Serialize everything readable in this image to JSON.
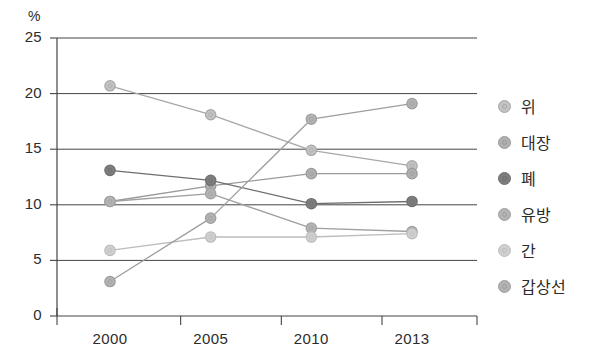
{
  "chart_data": {
    "type": "line",
    "title": "",
    "subtitle": "",
    "xlabel": "",
    "ylabel": "%",
    "unit_label": "%",
    "categories": [
      "2000",
      "2005",
      "2010",
      "2013"
    ],
    "x": [
      2000,
      2005,
      2010,
      2013
    ],
    "xtick_labels": [
      "2000",
      "2005",
      "2010",
      "2013"
    ],
    "ytick_labels": [
      "0",
      "5",
      "10",
      "15",
      "20",
      "25"
    ],
    "yticks": [
      0,
      5,
      10,
      15,
      20,
      25
    ],
    "ylim": [
      0,
      25
    ],
    "grid": "horizontal",
    "legend_position": "right",
    "markers": "circle",
    "series": [
      {
        "name": "위",
        "color": "#a8a8a8",
        "marker_fill": "#c2c2c2",
        "values": [
          20.7,
          18.1,
          14.9,
          13.5
        ]
      },
      {
        "name": "대장",
        "color": "#9a9a9a",
        "marker_fill": "#b0b0b0",
        "values": [
          10.3,
          11.7,
          12.8,
          12.8
        ]
      },
      {
        "name": "폐",
        "color": "#6e6e6e",
        "marker_fill": "#7d7d7d",
        "values": [
          13.1,
          12.2,
          10.1,
          10.3
        ]
      },
      {
        "name": "유방",
        "color": "#a0a0a0",
        "marker_fill": "#b4b4b4",
        "values": [
          10.3,
          11.0,
          7.9,
          7.6
        ]
      },
      {
        "name": "간",
        "color": "#bdbdbd",
        "marker_fill": "#cfcfcf",
        "values": [
          5.9,
          7.1,
          7.1,
          7.4
        ]
      },
      {
        "name": "갑상선",
        "color": "#9e9e9e",
        "marker_fill": "#b2b2b2",
        "values": [
          3.1,
          8.8,
          17.7,
          19.1
        ]
      }
    ]
  },
  "legend": {
    "items": [
      {
        "label": "위"
      },
      {
        "label": "대장"
      },
      {
        "label": "폐"
      },
      {
        "label": "유방"
      },
      {
        "label": "간"
      },
      {
        "label": "갑상선"
      }
    ]
  }
}
